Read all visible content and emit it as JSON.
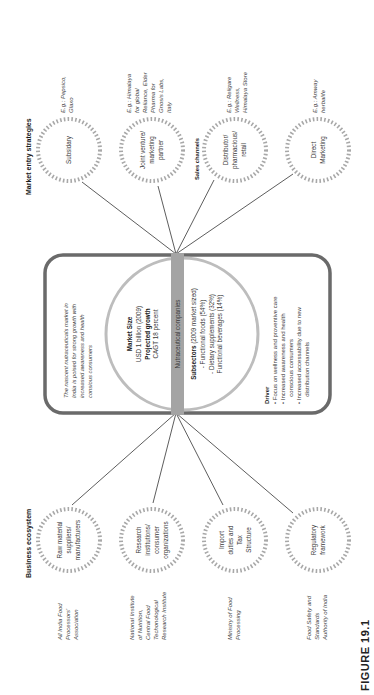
{
  "figure_label": "FIGURE 19.1",
  "colors": {
    "dotted_circle": "#a8a8a8",
    "box_border": "#6a6a6a",
    "center_bar": "#a4a4a4",
    "center_circle": "#bdbdbd",
    "lines": "#333333"
  },
  "market_entry": {
    "heading": "Market entry strategies",
    "sales_heading": "Sales channels",
    "nodes": [
      {
        "lines": [
          "Subsidary"
        ],
        "example": [
          "E.g.: Pepsico,",
          "Glaxo"
        ]
      },
      {
        "lines": [
          "Joint venture/",
          "marketing",
          "partner"
        ],
        "example": [
          "E.g.: Himalaya",
          "for global",
          "Reliance, Elder",
          "Pharma for",
          "Gnosis Labs,",
          "Italy"
        ]
      },
      {
        "lines": [
          "Distributor/",
          "pharmacious/",
          "retail"
        ],
        "example": [
          "E.g.: Religare",
          "Wellness,",
          "Himalaya Store"
        ]
      },
      {
        "lines": [
          "Direct",
          "Marketing"
        ],
        "example": [
          "E.g.: Amway",
          "herbalife"
        ]
      }
    ]
  },
  "business_ecosystem": {
    "heading": "Business ecosystem",
    "nodes": [
      {
        "lines": [
          "Raw material",
          "suppliers/",
          "manufacturers"
        ],
        "example": [
          "All India Food",
          "Processors'",
          "Association"
        ]
      },
      {
        "lines": [
          "Research",
          "institutions/",
          "consumer",
          "organizations"
        ],
        "example": [
          "National Institute",
          "of Nutrition,",
          "Central Food",
          "Techonological",
          "Research Institute"
        ]
      },
      {
        "lines": [
          "Import",
          "duties and",
          "Tax",
          "Structure"
        ],
        "example": [
          "Ministry of Food",
          "Processing"
        ]
      },
      {
        "lines": [
          "Regulatory",
          "framework"
        ],
        "example": [
          "Food Safety and",
          "Standards",
          "Authority of India"
        ]
      }
    ]
  },
  "center": {
    "intro": [
      "The nascent nutraceuticals market in",
      "India is poised for strong growth with",
      "increased awareness and health",
      "consious consumers"
    ],
    "market_size_label": "Market Size",
    "market_size_value": "USD 1 billion (2009)",
    "growth_label": "Projected growth",
    "growth_value": "CAGT 18 percent",
    "bar_label": "Nutraceutical companies",
    "subsectors_label": "Subsectors",
    "subsectors_note": " (2009 market sized)",
    "subsectors": [
      "- Functional foods (54%)",
      "- Dietary supplements (32%)",
      "Functional beverages (14%)"
    ],
    "driver_label": "Driver",
    "drivers": [
      "• Focus on wellness and proventive care",
      "• Increased awareness and health",
      "  conscious consumers",
      "• Increased accessability due to new",
      "  distribution channels"
    ]
  }
}
